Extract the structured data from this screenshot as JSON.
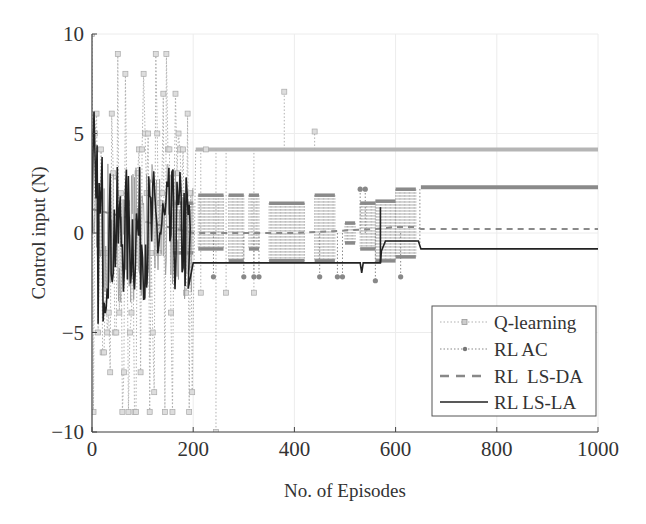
{
  "chart_data": {
    "type": "line",
    "title": "",
    "xlabel": "No. of Episodes",
    "ylabel": "Control input (N)",
    "xlim": [
      0,
      1000
    ],
    "ylim": [
      -10,
      10
    ],
    "xticks": [
      0,
      200,
      400,
      600,
      800,
      1000
    ],
    "yticks": [
      -10,
      -5,
      0,
      5,
      10
    ],
    "xtick_labels": [
      "0",
      "200",
      "400",
      "600",
      "800",
      "1000"
    ],
    "ytick_labels": [
      "−10",
      "−5",
      "0",
      "5",
      "10"
    ],
    "grid": true,
    "legend_position": "lower right",
    "series": [
      {
        "name": "Q-learning",
        "style": "dotted with square markers",
        "color": "#a8a8a8",
        "description": "Oscillates between -10 and 10 during episodes 0-200, sporadic spikes until ~440, then settles",
        "x": [
          0,
          10,
          20,
          40,
          60,
          80,
          100,
          120,
          140,
          160,
          180,
          200,
          220,
          250,
          300,
          380,
          440,
          500,
          600,
          700,
          800,
          900,
          1000
        ],
        "values": [
          7,
          -10,
          10,
          -10,
          10,
          -9,
          10,
          -10,
          10,
          -10,
          10,
          -10,
          4.2,
          -10,
          4.2,
          7.1,
          5.1,
          4.2,
          4.2,
          4.2,
          4.2,
          4.2,
          4.2
        ],
        "final_value": 4.2
      },
      {
        "name": "RL AC",
        "style": "dotted with dot markers",
        "color": "#888888",
        "description": "Switches between discrete levels (~-2.2 to 2.2) until ~650 episodes, then settles",
        "x": [
          0,
          50,
          100,
          150,
          200,
          250,
          300,
          350,
          400,
          450,
          500,
          550,
          600,
          640,
          650,
          700,
          800,
          900,
          1000
        ],
        "values": [
          1.5,
          -1.5,
          1.5,
          -2.7,
          1.5,
          -0.5,
          1.5,
          -1.4,
          1.5,
          -0.8,
          0.5,
          1.5,
          2.2,
          0.5,
          2.3,
          2.3,
          2.3,
          2.3,
          2.3
        ],
        "final_value": 2.3
      },
      {
        "name": "RL  LS-DA",
        "style": "dashed",
        "color": "#777777",
        "description": "Dashed gray trajectory overlapping the AC transitions, settling near 0.2",
        "x": [
          0,
          200,
          400,
          560,
          600,
          640,
          650,
          1000
        ],
        "values": [
          1.2,
          0.0,
          0.0,
          0.2,
          0.3,
          0.3,
          0.2,
          0.2
        ],
        "final_value": 0.2
      },
      {
        "name": "RL LS-LA",
        "style": "solid",
        "color": "#222222",
        "description": "Large oscillations in first 200 episodes, then steady near -1.5, step up at ~570, settles at -0.8 after 650",
        "x": [
          0,
          5,
          20,
          40,
          60,
          80,
          100,
          120,
          140,
          160,
          180,
          200,
          300,
          400,
          500,
          530,
          540,
          570,
          580,
          640,
          650,
          700,
          800,
          900,
          1000
        ],
        "values": [
          0,
          6.1,
          -3,
          4.8,
          -3.5,
          3.8,
          -3.2,
          2.5,
          4.9,
          -2.5,
          -2.8,
          -1.5,
          -1.5,
          -1.5,
          -1.5,
          -1.5,
          -1.8,
          -0.8,
          -0.4,
          -0.4,
          -0.8,
          -0.8,
          -0.8,
          -0.8,
          -0.8
        ],
        "final_value": -0.8
      }
    ]
  },
  "legend": {
    "items": [
      {
        "label": "Q-learning"
      },
      {
        "label": "RL AC"
      },
      {
        "label": "RL  LS-DA"
      },
      {
        "label": "RL LS-LA"
      }
    ]
  },
  "axes": {
    "xlabel": "No. of Episodes",
    "ylabel": "Control input (N)"
  }
}
